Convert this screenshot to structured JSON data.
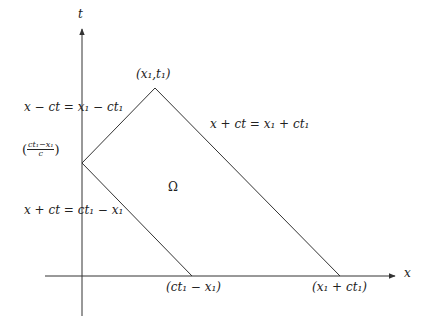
{
  "diagram": {
    "type": "spacetime characteristic domain",
    "axes": {
      "x_label": "x",
      "t_label": "t"
    },
    "points": {
      "apex": "(x₁,t₁)",
      "t_intercept_num": "ct₁−x₁",
      "t_intercept_den": "c",
      "x_intercept_left": "(ct₁ − x₁)",
      "x_intercept_right": "(x₁ + ct₁)"
    },
    "lines": {
      "upper_left": "x − ct = x₁ − ct₁",
      "upper_right": "x + ct = x₁ + ct₁",
      "lower_left": "x + ct = ct₁ − x₁"
    },
    "region_label": "Ω",
    "colors": {
      "line": "#333333",
      "background": "#ffffff"
    }
  }
}
